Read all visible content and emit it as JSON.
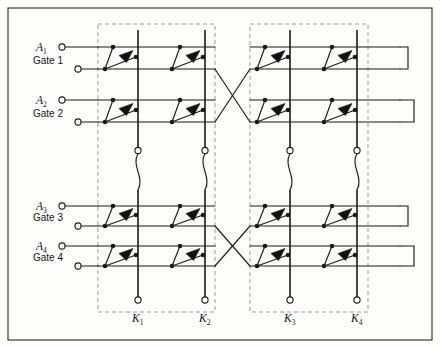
{
  "figure": {
    "background_color": "#fdfdfb",
    "line_color": "#1a1a1a",
    "dash_color": "#9a9a9a",
    "frame_color": "#3a3a3a"
  },
  "labels": {
    "inputs": [
      {
        "name": "A1",
        "base": "A",
        "sub": "1",
        "y": 47
      },
      {
        "name": "A2",
        "base": "A",
        "sub": "2",
        "y": 100
      },
      {
        "name": "A3",
        "base": "A",
        "sub": "3",
        "y": 206
      },
      {
        "name": "A4",
        "base": "A",
        "sub": "4",
        "y": 246
      }
    ],
    "gates": [
      {
        "text": "Gate 1",
        "y": 69
      },
      {
        "text": "Gate 2",
        "y": 122
      },
      {
        "text": "Gate 3",
        "y": 226
      },
      {
        "text": "Gate 4",
        "y": 266
      }
    ],
    "outputs": [
      {
        "name": "K1",
        "base": "K",
        "sub": "1",
        "x": 138
      },
      {
        "name": "K2",
        "base": "K",
        "sub": "2",
        "x": 205
      },
      {
        "name": "K3",
        "base": "K",
        "sub": "3",
        "x": 290
      },
      {
        "name": "K4",
        "base": "K",
        "sub": "4",
        "x": 357
      }
    ]
  },
  "geometry": {
    "frame": {
      "x": 8,
      "y": 8,
      "w": 424,
      "h": 332
    },
    "dashed_groups": [
      {
        "id": "group-left",
        "x": 98,
        "y": 24,
        "w": 117,
        "h": 288
      },
      {
        "id": "group-right",
        "x": 250,
        "y": 24,
        "w": 118,
        "h": 288
      }
    ],
    "rails_x": [
      138,
      205,
      290,
      357
    ],
    "rows_y": [
      47,
      69,
      100,
      122,
      206,
      226,
      246,
      266
    ],
    "cell_columns_x": [
      120,
      187,
      272,
      339
    ],
    "terminal_radius": 3.1
  },
  "counts": {
    "inputs": 4,
    "gates": 4,
    "outputs": 4,
    "switch_cells": 16
  }
}
